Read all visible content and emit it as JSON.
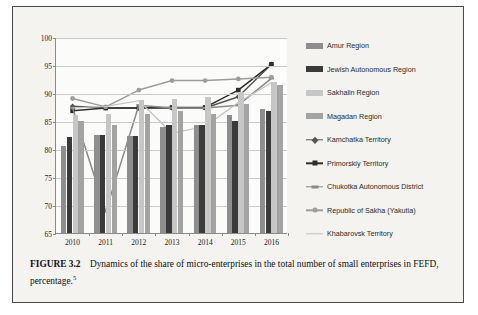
{
  "figure": {
    "caption_label": "FIGURE 3.2",
    "caption_text": "Dynamics of the share of micro-enterprises in the total number of small enterprises in FEFD, percentage.",
    "caption_footnote": "5"
  },
  "colors": {
    "page_background": "#f4f3f0",
    "plot_background": "#fbfbfa",
    "grid": "#c9c9c9",
    "axis": "#8a8a8a",
    "border": "#4a4a4a",
    "amur": "#8e8e8e",
    "jewish": "#3a3a3a",
    "sakhalin": "#c6c6c6",
    "magadan": "#a3a3a3",
    "kamchatka": "#555555",
    "primorskiy": "#2e2e2e",
    "chukotka": "#8a8a8a",
    "sakha": "#9d9d9d",
    "khabarovsk": "#c2c2c2"
  },
  "chart_data": {
    "type": "bar",
    "title": "",
    "xlabel": "",
    "ylabel": "",
    "ylim": [
      65,
      100
    ],
    "ytick_step": 5,
    "yticks": [
      65,
      70,
      75,
      80,
      85,
      90,
      95,
      100
    ],
    "grid": true,
    "legend_position": "right",
    "categories": [
      "2010",
      "2011",
      "2012",
      "2013",
      "2014",
      "2015",
      "2016"
    ],
    "bar_series": [
      {
        "name": "Amur Region",
        "color": "#8e8e8e",
        "values": [
          80.5,
          82.5,
          82.3,
          84.0,
          84.3,
          86.0,
          87.2
        ]
      },
      {
        "name": "Jewish Autonomous Region",
        "color": "#3a3a3a",
        "values": [
          82.2,
          82.5,
          82.3,
          84.2,
          84.2,
          85.0,
          86.8
        ]
      },
      {
        "name": "Sakhalin Region",
        "color": "#c6c6c6",
        "values": [
          86.0,
          86.3,
          88.8,
          89.0,
          89.3,
          90.2,
          92.0
        ]
      },
      {
        "name": "Magadan Region",
        "color": "#a3a3a3",
        "values": [
          85.0,
          84.3,
          86.3,
          86.8,
          86.3,
          88.0,
          91.5
        ]
      }
    ],
    "line_series": [
      {
        "name": "Kamchatka Territory",
        "color": "#555555",
        "marker": "diamond",
        "values": [
          87.8,
          87.5,
          87.5,
          87.5,
          87.5,
          89.5,
          95.3
        ]
      },
      {
        "name": "Primorskiy Territory",
        "color": "#2e2e2e",
        "marker": "square",
        "values": [
          87.0,
          87.5,
          87.5,
          87.6,
          87.6,
          90.7,
          95.3
        ]
      },
      {
        "name": "Chukotka Autonomous District",
        "color": "#8a8a8a",
        "marker": "dash",
        "values": [
          87.5,
          69.0,
          88.0,
          87.5,
          87.5,
          88.0,
          92.8
        ]
      },
      {
        "name": "Republic of Sakha (Yakutia)",
        "color": "#9d9d9d",
        "marker": "circle",
        "values": [
          89.2,
          87.7,
          90.7,
          92.4,
          92.4,
          92.7,
          93.0
        ]
      },
      {
        "name": "Khabarovsk Territory",
        "color": "#c2c2c2",
        "marker": "none",
        "values": [
          87.5,
          87.8,
          88.8,
          83.0,
          84.2,
          88.5,
          92.0
        ]
      }
    ]
  }
}
